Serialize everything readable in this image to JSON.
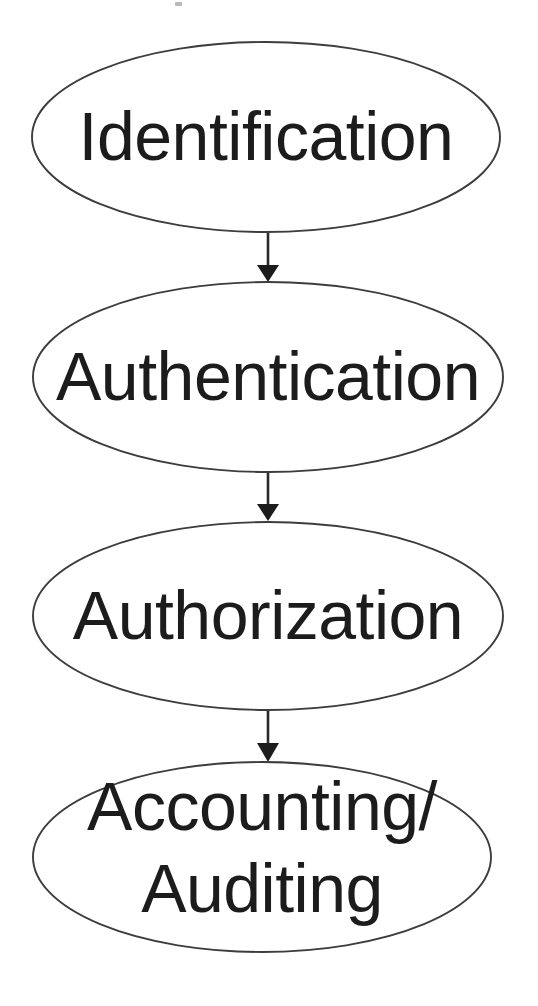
{
  "diagram": {
    "type": "flowchart",
    "orientation": "vertical-top-to-bottom",
    "background_color": "#ffffff",
    "node_fill_color": "#ffffff",
    "node_stroke_color": "#3c3c3c",
    "text_color": "#1c1c1c",
    "connector_color": "#1e1e1e",
    "nodes": [
      {
        "id": "identification",
        "shape": "ellipse",
        "label": "Identification",
        "lines": [
          "Identification"
        ],
        "cx": 266,
        "cy": 137,
        "rx": 234,
        "ry": 95
      },
      {
        "id": "authentication",
        "shape": "ellipse",
        "label": "Authentication",
        "lines": [
          "Authentication"
        ],
        "cx": 268,
        "cy": 377,
        "rx": 235,
        "ry": 95
      },
      {
        "id": "authorization",
        "shape": "ellipse",
        "label": "Authorization",
        "lines": [
          "Authorization"
        ],
        "cx": 268,
        "cy": 616,
        "rx": 235,
        "ry": 94
      },
      {
        "id": "accounting-auditing",
        "shape": "ellipse",
        "label": "Accounting/ Auditing",
        "lines": [
          "Accounting/",
          "Auditing"
        ],
        "cx": 262,
        "cy": 857,
        "rx": 229,
        "ry": 95
      }
    ],
    "connectors": [
      {
        "id": "arrow-identification-authentication",
        "from": "identification",
        "to": "authentication",
        "x": 268,
        "y_start": 233,
        "y_end": 281,
        "direction": "down"
      },
      {
        "id": "arrow-authentication-authorization",
        "from": "authentication",
        "to": "authorization",
        "x": 268,
        "y_start": 473,
        "y_end": 521,
        "direction": "down"
      },
      {
        "id": "arrow-authorization-accounting",
        "from": "authorization",
        "to": "accounting-auditing",
        "x": 268,
        "y_start": 711,
        "y_end": 761,
        "direction": "down"
      }
    ],
    "artifacts": [
      {
        "id": "scan-speck",
        "x": 175,
        "y": 2,
        "width": 7,
        "height": 4
      }
    ]
  }
}
